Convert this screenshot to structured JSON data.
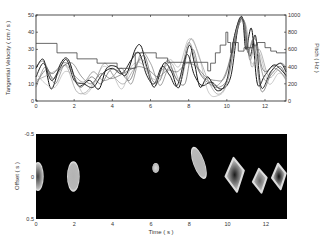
{
  "chart_data": [
    {
      "type": "line",
      "panel": "top",
      "xlabel": "",
      "ylabel": "Tangential Velocity ( cm / s )",
      "y2label": "Pitch ( Hz )",
      "xlim": [
        0,
        13.1
      ],
      "ylim": [
        0,
        50
      ],
      "y2lim": [
        0,
        1000
      ],
      "xticks": [
        0,
        2,
        4,
        6,
        8,
        10,
        12
      ],
      "yticks": [
        0,
        10,
        20,
        30,
        40,
        50
      ],
      "y2ticks": [
        0,
        200,
        400,
        600,
        800,
        1000
      ],
      "grid": false,
      "pitch_step": {
        "name": "Pitch",
        "axis": "right",
        "x": [
          0,
          1.1,
          2.15,
          3.2,
          4.25,
          5.2,
          6.3,
          6.9,
          7.2,
          8.6,
          9.0,
          9.15,
          9.4,
          9.65,
          9.95,
          10.05,
          10.2,
          10.3,
          10.6,
          10.9,
          11.2,
          11.4,
          11.6,
          12.0,
          12.3,
          12.6,
          13.1
        ],
        "y": [
          670,
          560,
          490,
          440,
          380,
          560,
          500,
          450,
          450,
          450,
          350,
          440,
          560,
          650,
          800,
          680,
          560,
          680,
          580,
          620,
          620,
          650,
          680,
          620,
          580,
          560,
          560
        ]
      },
      "series": [
        {
          "name": "trace-1",
          "shade": "#111111",
          "x": [
            0,
            0.4,
            0.8,
            1.3,
            1.7,
            2.2,
            2.8,
            3.3,
            3.7,
            4.2,
            4.7,
            5.2,
            5.5,
            5.8,
            6.2,
            6.7,
            7.1,
            7.5,
            8.0,
            8.3,
            8.6,
            9.0,
            9.5,
            10.0,
            10.4,
            10.8,
            11.0,
            11.3,
            11.6,
            12.0,
            12.5,
            13.1
          ],
          "y": [
            19,
            24,
            7,
            22,
            24,
            9,
            12,
            7,
            19,
            20,
            15,
            30,
            32,
            20,
            8,
            22,
            17,
            8,
            32,
            22,
            8,
            14,
            6,
            12,
            38,
            49,
            30,
            42,
            10,
            15,
            21,
            15
          ]
        },
        {
          "name": "trace-2",
          "shade": "#222222",
          "x": [
            0,
            0.4,
            0.8,
            1.2,
            1.6,
            2.0,
            2.5,
            3.0,
            3.5,
            4.0,
            4.5,
            5.0,
            5.4,
            5.8,
            6.2,
            6.6,
            7.0,
            7.4,
            7.9,
            8.3,
            8.7,
            9.2,
            9.7,
            10.2,
            10.6,
            10.9,
            11.2,
            11.5,
            11.8,
            12.3,
            12.8,
            13.1
          ],
          "y": [
            14,
            22,
            12,
            18,
            24,
            12,
            10,
            8,
            16,
            19,
            16,
            24,
            28,
            15,
            10,
            20,
            15,
            9,
            27,
            15,
            9,
            11,
            7,
            14,
            44,
            46,
            26,
            38,
            8,
            17,
            22,
            17
          ]
        },
        {
          "name": "trace-3",
          "shade": "#444444",
          "x": [
            0,
            0.5,
            0.9,
            1.4,
            1.8,
            2.3,
            2.9,
            3.4,
            3.9,
            4.4,
            4.9,
            5.3,
            5.7,
            6.1,
            6.5,
            6.9,
            7.3,
            7.8,
            8.2,
            8.6,
            9.1,
            9.6,
            10.1,
            10.5,
            10.8,
            11.1,
            11.4,
            11.8,
            12.3,
            12.8,
            13.1
          ],
          "y": [
            10,
            18,
            16,
            22,
            20,
            8,
            14,
            10,
            18,
            17,
            12,
            22,
            26,
            12,
            12,
            24,
            14,
            10,
            30,
            16,
            10,
            8,
            15,
            42,
            48,
            28,
            35,
            6,
            15,
            20,
            14
          ]
        },
        {
          "name": "trace-4",
          "shade": "#666666",
          "x": [
            0,
            0.5,
            1.0,
            1.5,
            2.0,
            2.5,
            3.0,
            3.5,
            4.0,
            4.5,
            5.0,
            5.5,
            6.0,
            6.5,
            7.0,
            7.5,
            8.0,
            8.5,
            9.0,
            9.5,
            10.0,
            10.5,
            10.9,
            11.2,
            11.5,
            12.0,
            12.5,
            13.1
          ],
          "y": [
            8,
            20,
            10,
            21,
            15,
            11,
            17,
            12,
            14,
            19,
            10,
            28,
            22,
            9,
            20,
            12,
            34,
            18,
            12,
            9,
            18,
            40,
            47,
            24,
            32,
            12,
            19,
            13
          ]
        },
        {
          "name": "trace-5",
          "shade": "#888888",
          "x": [
            0,
            0.6,
            1.1,
            1.6,
            2.1,
            2.6,
            3.1,
            3.6,
            4.1,
            4.6,
            5.1,
            5.6,
            6.1,
            6.6,
            7.1,
            7.6,
            8.1,
            8.6,
            9.1,
            9.6,
            10.1,
            10.6,
            11.0,
            11.3,
            11.7,
            12.2,
            12.7,
            13.1
          ],
          "y": [
            12,
            15,
            18,
            20,
            6,
            5,
            12,
            22,
            14,
            10,
            18,
            24,
            10,
            18,
            22,
            12,
            36,
            24,
            10,
            4,
            14,
            45,
            44,
            20,
            30,
            14,
            18,
            12
          ]
        },
        {
          "name": "trace-6",
          "shade": "#aaaaaa",
          "x": [
            0,
            0.5,
            1.0,
            1.5,
            2.0,
            2.5,
            3.0,
            3.5,
            4.0,
            4.5,
            5.0,
            5.5,
            6.0,
            6.5,
            7.0,
            7.5,
            8.0,
            8.5,
            9.0,
            9.5,
            10.0,
            10.5,
            10.9,
            11.3,
            11.7,
            12.2,
            12.7,
            13.1
          ],
          "y": [
            16,
            10,
            8,
            17,
            14,
            4,
            9,
            20,
            16,
            7,
            20,
            22,
            14,
            13,
            24,
            20,
            36,
            28,
            6,
            3,
            10,
            40,
            45,
            22,
            28,
            10,
            16,
            14
          ]
        },
        {
          "name": "trace-7",
          "shade": "#555555",
          "x": [
            0,
            0.4,
            0.9,
            1.4,
            1.9,
            2.4,
            2.9,
            3.4,
            3.9,
            4.4,
            4.9,
            5.4,
            5.9,
            6.4,
            6.9,
            7.4,
            7.9,
            8.4,
            8.9,
            9.4,
            9.9,
            10.4,
            10.8,
            11.1,
            11.5,
            11.9,
            12.4,
            12.9,
            13.1
          ],
          "y": [
            20,
            23,
            13,
            20,
            22,
            14,
            10,
            16,
            13,
            15,
            18,
            20,
            18,
            14,
            18,
            17,
            22,
            20,
            14,
            12,
            14,
            34,
            48,
            30,
            36,
            18,
            20,
            22,
            18
          ]
        }
      ]
    },
    {
      "type": "heatmap",
      "panel": "bottom",
      "xlabel": "Time ( s )",
      "ylabel": "Offset ( s )",
      "xlim": [
        0,
        13.1
      ],
      "ylim": [
        -0.5,
        0.5
      ],
      "ylim_direction": "reversed",
      "xticks": [
        0,
        2,
        4,
        6,
        8,
        10,
        12
      ],
      "yticks": [
        -0.5,
        0,
        0.5
      ],
      "ytick_labels": [
        "-0.5",
        "0",
        "0.5"
      ],
      "background": "#000000",
      "colormap": "gray",
      "blobs": [
        {
          "t_center": 0.1,
          "offset_center": 0.0,
          "t_halfwidth": 0.3,
          "offset_halfwidth": 0.17,
          "peak": 0.25,
          "shape": "half-ellipse"
        },
        {
          "t_center": 1.95,
          "offset_center": 0.0,
          "t_halfwidth": 0.33,
          "offset_halfwidth": 0.18,
          "peak": 0.7,
          "shape": "ellipse"
        },
        {
          "t_center": 6.25,
          "offset_center": -0.1,
          "t_halfwidth": 0.18,
          "offset_halfwidth": 0.06,
          "peak": 0.85,
          "shape": "ellipse"
        },
        {
          "t_center": 8.5,
          "offset_center": -0.16,
          "t_halfwidth": 0.3,
          "offset_halfwidth": 0.2,
          "peak": 0.7,
          "shape": "tilted"
        },
        {
          "t_center": 10.4,
          "offset_center": -0.02,
          "t_halfwidth": 0.6,
          "offset_halfwidth": 0.2,
          "peak": 0.1,
          "shape": "diamond"
        },
        {
          "t_center": 11.7,
          "offset_center": 0.05,
          "t_halfwidth": 0.45,
          "offset_halfwidth": 0.14,
          "peak": 0.4,
          "shape": "diamond"
        },
        {
          "t_center": 12.7,
          "offset_center": 0.0,
          "t_halfwidth": 0.45,
          "offset_halfwidth": 0.15,
          "peak": 0.05,
          "shape": "diamond"
        }
      ]
    }
  ]
}
